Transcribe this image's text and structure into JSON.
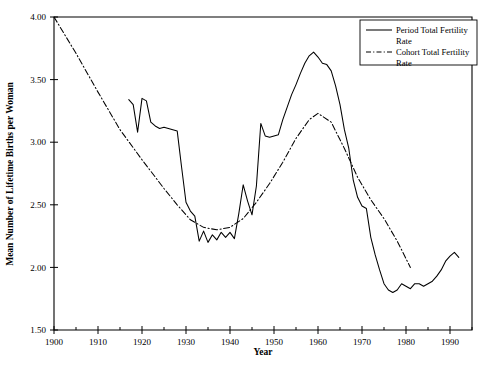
{
  "chart_data": {
    "type": "line",
    "title": "",
    "xlabel": "Year",
    "ylabel": "Mean Number of Lifetime Births per Woman",
    "xlim": [
      1900,
      1995
    ],
    "ylim": [
      1.5,
      4.0
    ],
    "grid": false,
    "legend_position": "top-right",
    "x_ticks": [
      1900,
      1910,
      1920,
      1930,
      1940,
      1950,
      1960,
      1970,
      1980,
      1990
    ],
    "x_minor_ticks": [
      1905,
      1915,
      1925,
      1935,
      1945,
      1955,
      1965,
      1975,
      1985,
      1995
    ],
    "y_ticks": [
      1.5,
      2.0,
      2.5,
      3.0,
      3.5,
      4.0
    ],
    "y_tick_labels": [
      "1.50",
      "2.00",
      "2.50",
      "3.00",
      "3.50",
      "4.00"
    ],
    "series": [
      {
        "name": "Period Total Fertility Rate",
        "style": "solid",
        "color": "#000000",
        "x": [
          1917,
          1918,
          1919,
          1920,
          1921,
          1922,
          1923,
          1924,
          1925,
          1926,
          1927,
          1928,
          1929,
          1930,
          1931,
          1932,
          1933,
          1934,
          1935,
          1936,
          1937,
          1938,
          1939,
          1940,
          1941,
          1942,
          1943,
          1944,
          1945,
          1946,
          1947,
          1948,
          1949,
          1950,
          1951,
          1952,
          1953,
          1954,
          1955,
          1956,
          1957,
          1958,
          1959,
          1960,
          1961,
          1962,
          1963,
          1964,
          1965,
          1966,
          1967,
          1968,
          1969,
          1970,
          1971,
          1972,
          1973,
          1974,
          1975,
          1976,
          1977,
          1978,
          1979,
          1980,
          1981,
          1982,
          1983,
          1984,
          1985,
          1986,
          1987,
          1988,
          1989,
          1990,
          1991,
          1992
        ],
        "values": [
          3.34,
          3.3,
          3.08,
          3.35,
          3.33,
          3.16,
          3.13,
          3.11,
          3.12,
          3.11,
          3.1,
          3.09,
          2.8,
          2.52,
          2.45,
          2.41,
          2.21,
          2.29,
          2.2,
          2.26,
          2.22,
          2.28,
          2.24,
          2.28,
          2.23,
          2.43,
          2.66,
          2.53,
          2.42,
          2.65,
          3.15,
          3.05,
          3.04,
          3.05,
          3.06,
          3.18,
          3.28,
          3.38,
          3.46,
          3.55,
          3.63,
          3.69,
          3.72,
          3.68,
          3.63,
          3.62,
          3.57,
          3.45,
          3.3,
          3.1,
          2.95,
          2.7,
          2.56,
          2.49,
          2.47,
          2.24,
          2.1,
          1.98,
          1.87,
          1.82,
          1.8,
          1.82,
          1.87,
          1.85,
          1.83,
          1.87,
          1.87,
          1.85,
          1.87,
          1.89,
          1.93,
          1.98,
          2.05,
          2.09,
          2.12,
          2.08
        ]
      },
      {
        "name": "Cohort Total Fertility Rate",
        "style": "dash-dot",
        "color": "#000000",
        "x": [
          1900,
          1905,
          1910,
          1915,
          1920,
          1925,
          1928,
          1931,
          1934,
          1937,
          1940,
          1943,
          1946,
          1949,
          1952,
          1955,
          1958,
          1960,
          1963,
          1966,
          1969,
          1972,
          1975,
          1978,
          1981
        ],
        "values": [
          4.0,
          3.71,
          3.4,
          3.1,
          2.86,
          2.63,
          2.5,
          2.38,
          2.32,
          2.3,
          2.32,
          2.39,
          2.52,
          2.67,
          2.84,
          3.03,
          3.18,
          3.23,
          3.16,
          2.95,
          2.72,
          2.54,
          2.39,
          2.21,
          2.0
        ]
      }
    ]
  },
  "legend": {
    "entries": [
      {
        "label": "Period Total Fertility Rate",
        "style": "solid"
      },
      {
        "label": "Cohort Total Fertility Rate",
        "style": "dash-dot"
      }
    ]
  }
}
